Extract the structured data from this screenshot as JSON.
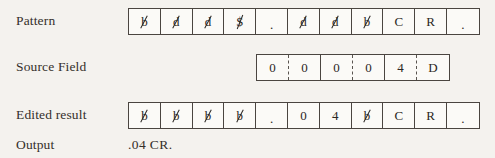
{
  "figure": {
    "background_color": "#f4f2ee",
    "ink_color": "#2b2723",
    "border_color": "#4a4540"
  },
  "rows": {
    "pattern": {
      "label": "Pattern",
      "cells": [
        {
          "text": "b",
          "glyph": "blank-slashed-b",
          "slashed": true
        },
        {
          "text": "d",
          "glyph": "digit-select-slashed-d",
          "slashed": true
        },
        {
          "text": "d",
          "glyph": "digit-select-slashed-d",
          "slashed": true
        },
        {
          "text": "$",
          "glyph": "significance-start-slashed-dollar",
          "slashed": true
        },
        {
          "text": ".",
          "glyph": "period",
          "slashed": false
        },
        {
          "text": "d",
          "glyph": "digit-select-slashed-d",
          "slashed": true
        },
        {
          "text": "d",
          "glyph": "digit-select-slashed-d",
          "slashed": true
        },
        {
          "text": "b",
          "glyph": "blank-slashed-b",
          "slashed": true
        },
        {
          "text": "C",
          "glyph": "letter-c",
          "slashed": false
        },
        {
          "text": "R",
          "glyph": "letter-r",
          "slashed": false
        },
        {
          "text": ".",
          "glyph": "period",
          "slashed": false
        }
      ]
    },
    "source": {
      "label": "Source Field",
      "cells": [
        {
          "text": "0",
          "glyph": "digit-zero",
          "slashed": false,
          "divider_right": "dashed"
        },
        {
          "text": "0",
          "glyph": "digit-zero",
          "slashed": false,
          "divider_right": "solid"
        },
        {
          "text": "0",
          "glyph": "digit-zero",
          "slashed": false,
          "divider_right": "dashed"
        },
        {
          "text": "0",
          "glyph": "digit-zero",
          "slashed": false,
          "divider_right": "solid"
        },
        {
          "text": "4",
          "glyph": "digit-four",
          "slashed": false,
          "divider_right": "dashed"
        },
        {
          "text": "D",
          "glyph": "letter-d-sign",
          "slashed": false,
          "divider_right": "none"
        }
      ]
    },
    "edited": {
      "label": "Edited result",
      "cells": [
        {
          "text": "b",
          "glyph": "blank-slashed-b",
          "slashed": true
        },
        {
          "text": "b",
          "glyph": "blank-slashed-b",
          "slashed": true
        },
        {
          "text": "b",
          "glyph": "blank-slashed-b",
          "slashed": true
        },
        {
          "text": "b",
          "glyph": "blank-slashed-b",
          "slashed": true
        },
        {
          "text": ".",
          "glyph": "period",
          "slashed": false
        },
        {
          "text": "0",
          "glyph": "digit-zero",
          "slashed": false
        },
        {
          "text": "4",
          "glyph": "digit-four",
          "slashed": false
        },
        {
          "text": "b",
          "glyph": "blank-slashed-b",
          "slashed": true
        },
        {
          "text": "C",
          "glyph": "letter-c",
          "slashed": false
        },
        {
          "text": "R",
          "glyph": "letter-r",
          "slashed": false
        },
        {
          "text": ".",
          "glyph": "period",
          "slashed": false
        }
      ]
    },
    "output": {
      "label": "Output",
      "value": ".04 CR."
    }
  }
}
